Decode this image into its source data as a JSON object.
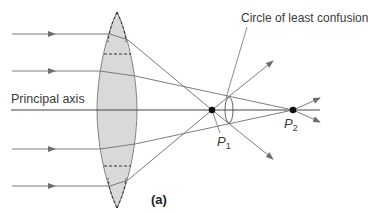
{
  "figure": {
    "type": "ray-optics diagram",
    "caption": "(a)",
    "labels": {
      "principal_axis": "Principal axis",
      "circle_of_least_confusion": "Circle of least confusion",
      "p1_letter": "P",
      "p1_sub": "1",
      "p2_letter": "P",
      "p2_sub": "2"
    },
    "colors": {
      "lens_fill": "#d9d9d9",
      "ray": "#6e6e6e",
      "axis": "#444444",
      "point": "#111111",
      "text": "#3a3a3a"
    },
    "geometry": {
      "principal_axis_y": 110,
      "lens": {
        "center_x": 117,
        "top_y": 12,
        "bottom_y": 208,
        "half_width": 20
      },
      "incident_rays_y": [
        34,
        71,
        149,
        186
      ],
      "focal_points": {
        "P1": [
          212,
          110
        ],
        "P2": [
          293,
          110
        ]
      }
    }
  }
}
